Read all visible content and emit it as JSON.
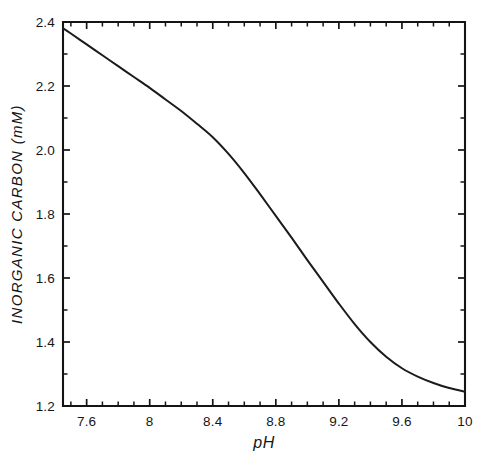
{
  "chart_data": {
    "type": "line",
    "title": "",
    "xlabel": "pH",
    "ylabel": "INORGANIC CARBON (mM)",
    "xlim": [
      7.45,
      10.0
    ],
    "ylim": [
      1.2,
      2.4
    ],
    "grid": false,
    "legend": null,
    "x_ticklabels": [
      "7.6",
      "8",
      "8.4",
      "8.8",
      "9.2",
      "9.6",
      "10"
    ],
    "x_tickvalues": [
      7.6,
      8.0,
      8.4,
      8.8,
      9.2,
      9.6,
      10.0
    ],
    "x_minor_tickvalues": [
      7.5,
      7.7,
      7.8,
      7.9,
      8.1,
      8.2,
      8.3,
      8.5,
      8.6,
      8.7,
      8.9,
      9.0,
      9.1,
      9.3,
      9.4,
      9.5,
      9.7,
      9.8,
      9.9
    ],
    "y_ticklabels": [
      "1.2",
      "1.4",
      "1.6",
      "1.8",
      "2.0",
      "2.2",
      "2.4"
    ],
    "y_tickvalues": [
      1.2,
      1.4,
      1.6,
      1.8,
      2.0,
      2.2,
      2.4
    ],
    "y_minor_tickvalues": [
      1.3,
      1.5,
      1.7,
      1.9,
      2.1,
      2.3
    ],
    "series": [
      {
        "name": "inorganic carbon",
        "color": "#1b1b1b",
        "x": [
          7.45,
          7.5,
          7.6,
          7.7,
          7.8,
          7.9,
          8.0,
          8.1,
          8.2,
          8.3,
          8.4,
          8.5,
          8.6,
          8.7,
          8.8,
          8.9,
          9.0,
          9.1,
          9.2,
          9.3,
          9.4,
          9.5,
          9.6,
          9.7,
          9.8,
          9.9,
          10.0
        ],
        "y": [
          2.38,
          2.364,
          2.33,
          2.296,
          2.262,
          2.228,
          2.194,
          2.158,
          2.122,
          2.082,
          2.04,
          1.988,
          1.928,
          1.862,
          1.794,
          1.726,
          1.656,
          1.588,
          1.52,
          1.456,
          1.4,
          1.354,
          1.318,
          1.292,
          1.272,
          1.256,
          1.245
        ]
      }
    ]
  },
  "figure": {
    "background_color": "#ffffff",
    "axis_color": "#141414",
    "curve_color": "#1b1b1b"
  }
}
